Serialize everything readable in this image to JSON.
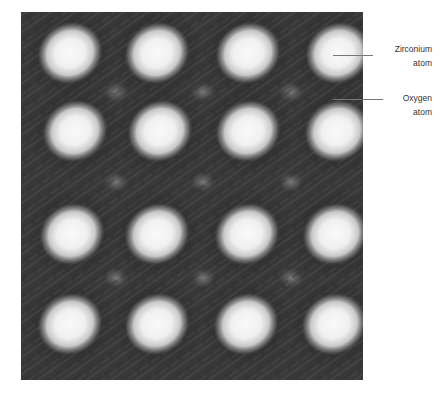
{
  "figure": {
    "lattice": {
      "rows": 4,
      "cols": 4,
      "atom_positions": [
        [
          [
            49,
            41
          ],
          [
            136,
            41
          ],
          [
            227,
            41
          ],
          [
            317,
            41
          ]
        ],
        [
          [
            54,
            119
          ],
          [
            139,
            119
          ],
          [
            227,
            119
          ],
          [
            316,
            119
          ]
        ],
        [
          [
            51,
            222
          ],
          [
            136,
            222
          ],
          [
            226,
            222
          ],
          [
            314,
            222
          ]
        ],
        [
          [
            49,
            312
          ],
          [
            136,
            312
          ],
          [
            225,
            312
          ],
          [
            313,
            312
          ]
        ]
      ],
      "oxygen_positions": [
        [
          95,
          80
        ],
        [
          182,
          80
        ],
        [
          270,
          80
        ],
        [
          95,
          170
        ],
        [
          182,
          170
        ],
        [
          270,
          170
        ],
        [
          95,
          266
        ],
        [
          182,
          266
        ],
        [
          270,
          266
        ]
      ],
      "colors": {
        "background": "#3a3a3a",
        "dark": "#1e1e1e",
        "atom_core": "#f4f4f4",
        "atom_halo": "#9a9a9a",
        "oxygen": "#6a6a6a"
      }
    },
    "annotations": [
      {
        "id": "zirconium",
        "line1": "Zirconium",
        "line2": "atom"
      },
      {
        "id": "oxygen",
        "line1": "Oxygen",
        "line2": "atom"
      }
    ]
  }
}
